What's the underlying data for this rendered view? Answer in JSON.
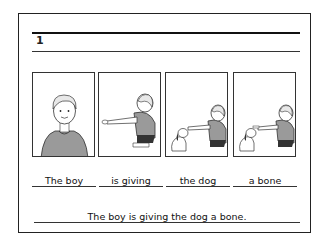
{
  "card": {
    "number": "1",
    "panels": [
      {
        "image": "boy-standing-illustration"
      },
      {
        "image": "boy-crouching-reaching-illustration"
      },
      {
        "image": "boy-giving-to-dog-illustration"
      },
      {
        "image": "boy-giving-bone-to-dog-illustration"
      }
    ],
    "words": [
      "The boy",
      "is giving",
      "the dog",
      "a bone"
    ],
    "sentence": "The boy is giving the dog a bone."
  }
}
